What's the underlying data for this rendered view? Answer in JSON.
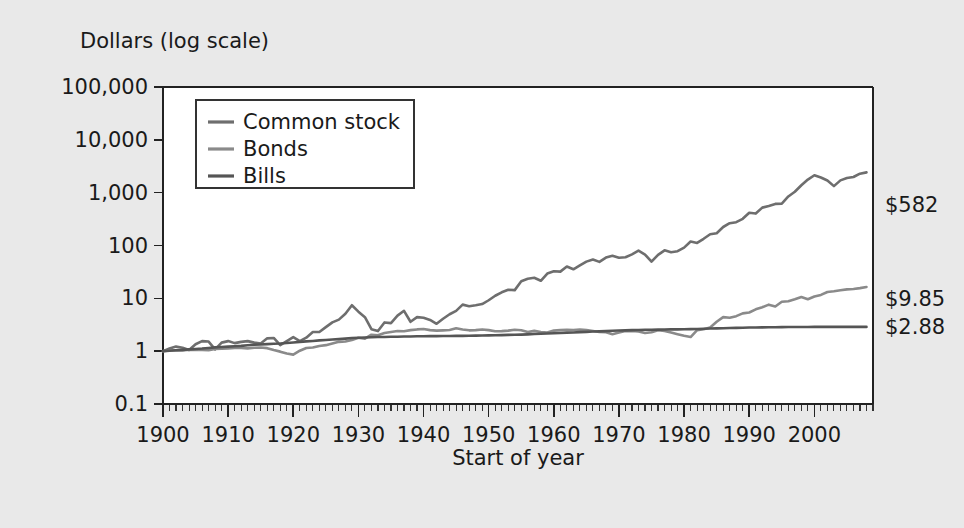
{
  "figure": {
    "background_color": "#e9e9e9",
    "plot_background_color": "#ffffff"
  },
  "chart_data": {
    "type": "line",
    "title": "",
    "ylabel": "Dollars (log scale)",
    "xlabel": "Start of year",
    "yscale": "log",
    "ylim": [
      0.1,
      100000
    ],
    "xlim": [
      1900,
      2009
    ],
    "grid": false,
    "legend_position": "upper left inside",
    "ytick_labels": [
      "100,000",
      "10,000",
      "1,000",
      "100",
      "10",
      "1",
      "0.1"
    ],
    "ytick_values": [
      100000,
      10000,
      1000,
      100,
      10,
      1,
      0.1
    ],
    "xtick_labels": [
      "1900",
      "1910",
      "1920",
      "1930",
      "1940",
      "1950",
      "1960",
      "1970",
      "1980",
      "1990",
      "2000"
    ],
    "xtick_values": [
      1900,
      1910,
      1920,
      1930,
      1940,
      1950,
      1960,
      1970,
      1980,
      1990,
      2000
    ],
    "xminor_step": 1,
    "end_labels": [
      {
        "series": "Common stock",
        "text": "$582",
        "value": 582
      },
      {
        "series": "Bonds",
        "text": "$9.85",
        "value": 9.85
      },
      {
        "series": "Bills",
        "text": "$2.88",
        "value": 2.88
      }
    ],
    "series": [
      {
        "name": "Common stock",
        "color": "#6e6e6e",
        "x": [
          1900,
          1901,
          1902,
          1903,
          1904,
          1905,
          1906,
          1907,
          1908,
          1909,
          1910,
          1911,
          1912,
          1913,
          1914,
          1915,
          1916,
          1917,
          1918,
          1919,
          1920,
          1921,
          1922,
          1923,
          1924,
          1925,
          1926,
          1927,
          1928,
          1929,
          1930,
          1931,
          1932,
          1933,
          1934,
          1935,
          1936,
          1937,
          1938,
          1939,
          1940,
          1941,
          1942,
          1943,
          1944,
          1945,
          1946,
          1947,
          1948,
          1949,
          1950,
          1951,
          1952,
          1953,
          1954,
          1955,
          1956,
          1957,
          1958,
          1959,
          1960,
          1961,
          1962,
          1963,
          1964,
          1965,
          1966,
          1967,
          1968,
          1969,
          1970,
          1971,
          1972,
          1973,
          1974,
          1975,
          1976,
          1977,
          1978,
          1979,
          1980,
          1981,
          1982,
          1983,
          1984,
          1985,
          1986,
          1987,
          1988,
          1989,
          1990,
          1991,
          1992,
          1993,
          1994,
          1995,
          1996,
          1997,
          1998,
          1999,
          2000,
          2001,
          2002,
          2003,
          2004,
          2005,
          2006,
          2007,
          2008
        ],
        "values": [
          1.0,
          1.12,
          1.22,
          1.16,
          1.05,
          1.35,
          1.55,
          1.52,
          1.08,
          1.45,
          1.55,
          1.42,
          1.5,
          1.55,
          1.45,
          1.4,
          1.75,
          1.78,
          1.3,
          1.55,
          1.85,
          1.55,
          1.8,
          2.3,
          2.3,
          2.85,
          3.5,
          3.95,
          5.1,
          7.4,
          5.6,
          4.4,
          2.6,
          2.4,
          3.5,
          3.4,
          4.7,
          5.8,
          3.6,
          4.4,
          4.3,
          3.9,
          3.3,
          4.1,
          5.0,
          5.8,
          7.6,
          7.1,
          7.4,
          7.8,
          9.2,
          11.2,
          13.0,
          14.5,
          14.3,
          21.0,
          23.5,
          24.5,
          21.5,
          29.5,
          32.5,
          32.0,
          40.0,
          35.5,
          42.0,
          49.5,
          54.5,
          49.0,
          59.0,
          64.0,
          58.5,
          60.0,
          68.0,
          80.0,
          67.5,
          49.5,
          66.5,
          81.0,
          74.5,
          78.0,
          91.0,
          119.0,
          112.0,
          134.0,
          163.0,
          171.0,
          224.0,
          264.0,
          276.0,
          320.0,
          418.0,
          402.0,
          521.0,
          559.0,
          613.0,
          619.0,
          848.0,
          1040.0,
          1380.0,
          1770.0,
          2140.0,
          1940.0,
          1700.0,
          1330.0,
          1710.0,
          1890.0,
          1980.0,
          2290.0,
          2420.0
        ]
      },
      {
        "name": "Bonds",
        "color": "#8a8a8a",
        "x": [
          1900,
          1901,
          1902,
          1903,
          1904,
          1905,
          1906,
          1907,
          1908,
          1909,
          1910,
          1911,
          1912,
          1913,
          1914,
          1915,
          1916,
          1917,
          1918,
          1919,
          1920,
          1921,
          1922,
          1923,
          1924,
          1925,
          1926,
          1927,
          1928,
          1929,
          1930,
          1931,
          1932,
          1933,
          1934,
          1935,
          1936,
          1937,
          1938,
          1939,
          1940,
          1941,
          1942,
          1943,
          1944,
          1945,
          1946,
          1947,
          1948,
          1949,
          1950,
          1951,
          1952,
          1953,
          1954,
          1955,
          1956,
          1957,
          1958,
          1959,
          1960,
          1961,
          1962,
          1963,
          1964,
          1965,
          1966,
          1967,
          1968,
          1969,
          1970,
          1971,
          1972,
          1973,
          1974,
          1975,
          1976,
          1977,
          1978,
          1979,
          1980,
          1981,
          1982,
          1983,
          1984,
          1985,
          1986,
          1987,
          1988,
          1989,
          1990,
          1991,
          1992,
          1993,
          1994,
          1995,
          1996,
          1997,
          1998,
          1999,
          2000,
          2001,
          2002,
          2003,
          2004,
          2005,
          2006,
          2007,
          2008
        ],
        "values": [
          1.0,
          1.03,
          1.04,
          1.03,
          1.06,
          1.07,
          1.05,
          1.04,
          1.1,
          1.11,
          1.12,
          1.15,
          1.15,
          1.13,
          1.16,
          1.17,
          1.14,
          1.05,
          0.98,
          0.9,
          0.86,
          1.02,
          1.15,
          1.17,
          1.25,
          1.3,
          1.4,
          1.5,
          1.52,
          1.62,
          1.8,
          1.72,
          2.05,
          2.0,
          2.2,
          2.3,
          2.4,
          2.38,
          2.5,
          2.58,
          2.62,
          2.5,
          2.45,
          2.48,
          2.52,
          2.72,
          2.58,
          2.48,
          2.5,
          2.58,
          2.5,
          2.38,
          2.4,
          2.45,
          2.55,
          2.48,
          2.3,
          2.42,
          2.3,
          2.25,
          2.45,
          2.5,
          2.55,
          2.52,
          2.56,
          2.5,
          2.4,
          2.3,
          2.28,
          2.1,
          2.25,
          2.4,
          2.42,
          2.35,
          2.2,
          2.28,
          2.48,
          2.4,
          2.25,
          2.1,
          1.95,
          1.85,
          2.5,
          2.6,
          2.8,
          3.6,
          4.4,
          4.3,
          4.6,
          5.2,
          5.4,
          6.2,
          6.8,
          7.6,
          7.0,
          8.6,
          8.8,
          9.6,
          10.6,
          9.6,
          10.8,
          11.6,
          13.2,
          13.6,
          14.2,
          14.8,
          15.0,
          15.6,
          16.4
        ]
      },
      {
        "name": "Bills",
        "color": "#555555",
        "x": [
          1900,
          1901,
          1902,
          1903,
          1904,
          1905,
          1906,
          1907,
          1908,
          1909,
          1910,
          1911,
          1912,
          1913,
          1914,
          1915,
          1916,
          1917,
          1918,
          1919,
          1920,
          1921,
          1922,
          1923,
          1924,
          1925,
          1926,
          1927,
          1928,
          1929,
          1930,
          1931,
          1932,
          1933,
          1934,
          1935,
          1936,
          1937,
          1938,
          1939,
          1940,
          1941,
          1942,
          1943,
          1944,
          1945,
          1946,
          1947,
          1948,
          1949,
          1950,
          1951,
          1952,
          1953,
          1954,
          1955,
          1956,
          1957,
          1958,
          1959,
          1960,
          1961,
          1962,
          1963,
          1964,
          1965,
          1966,
          1967,
          1968,
          1969,
          1970,
          1971,
          1972,
          1973,
          1974,
          1975,
          1976,
          1977,
          1978,
          1979,
          1980,
          1981,
          1982,
          1983,
          1984,
          1985,
          1986,
          1987,
          1988,
          1989,
          1990,
          1991,
          1992,
          1993,
          1994,
          1995,
          1996,
          1997,
          1998,
          1999,
          2000,
          2001,
          2002,
          2003,
          2004,
          2005,
          2006,
          2007,
          2008
        ],
        "values": [
          1.0,
          1.02,
          1.04,
          1.06,
          1.08,
          1.1,
          1.12,
          1.15,
          1.18,
          1.2,
          1.22,
          1.24,
          1.26,
          1.29,
          1.32,
          1.34,
          1.36,
          1.38,
          1.4,
          1.43,
          1.46,
          1.5,
          1.53,
          1.56,
          1.6,
          1.63,
          1.66,
          1.69,
          1.73,
          1.77,
          1.8,
          1.82,
          1.84,
          1.85,
          1.86,
          1.87,
          1.88,
          1.89,
          1.9,
          1.91,
          1.92,
          1.93,
          1.93,
          1.94,
          1.94,
          1.95,
          1.95,
          1.96,
          1.97,
          1.98,
          1.99,
          2.0,
          2.01,
          2.03,
          2.04,
          2.06,
          2.08,
          2.11,
          2.13,
          2.16,
          2.19,
          2.21,
          2.24,
          2.26,
          2.29,
          2.32,
          2.35,
          2.37,
          2.4,
          2.43,
          2.46,
          2.48,
          2.5,
          2.52,
          2.54,
          2.55,
          2.56,
          2.57,
          2.58,
          2.59,
          2.6,
          2.61,
          2.63,
          2.65,
          2.68,
          2.7,
          2.72,
          2.74,
          2.76,
          2.78,
          2.8,
          2.81,
          2.82,
          2.83,
          2.84,
          2.85,
          2.86,
          2.86,
          2.87,
          2.87,
          2.88,
          2.88,
          2.88,
          2.88,
          2.88,
          2.88,
          2.88,
          2.88,
          2.88
        ]
      }
    ],
    "legend": [
      {
        "label": "Common stock",
        "color": "#6e6e6e"
      },
      {
        "label": "Bonds",
        "color": "#8a8a8a"
      },
      {
        "label": "Bills",
        "color": "#555555"
      }
    ]
  }
}
